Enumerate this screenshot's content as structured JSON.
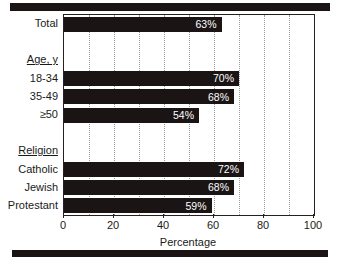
{
  "chart_data": {
    "type": "bar",
    "orientation": "horizontal",
    "title": "",
    "xlabel": "Percentage",
    "ylabel": "",
    "xlim": [
      0,
      100
    ],
    "xticks": [
      0,
      20,
      40,
      60,
      80,
      100
    ],
    "xtick_labels": [
      "0",
      "20",
      "40",
      "60",
      "80",
      "100"
    ],
    "gridlines": [
      10,
      20,
      30,
      40,
      50,
      60,
      70,
      80,
      90
    ],
    "grid": true,
    "legend": null,
    "bar_color": "#1a1414",
    "value_label_color": "#ffffff",
    "value_label_suffix": "%",
    "categories": [
      "Total",
      "18-34",
      "35-49",
      "≥50",
      "Catholic",
      "Jewish",
      "Protestant"
    ],
    "values": [
      63,
      70,
      68,
      54,
      72,
      68,
      59
    ],
    "rows": [
      {
        "kind": "bar",
        "label": "Total",
        "value": 63,
        "value_label": "63%"
      },
      {
        "kind": "spacer",
        "label": "",
        "value": null,
        "value_label": ""
      },
      {
        "kind": "header",
        "label": "Age, y",
        "value": null,
        "value_label": ""
      },
      {
        "kind": "bar",
        "label": "18-34",
        "value": 70,
        "value_label": "70%"
      },
      {
        "kind": "bar",
        "label": "35-49",
        "value": 68,
        "value_label": "68%"
      },
      {
        "kind": "bar",
        "label": "≥50",
        "value": 54,
        "value_label": "54%"
      },
      {
        "kind": "spacer",
        "label": "",
        "value": null,
        "value_label": ""
      },
      {
        "kind": "header",
        "label": "Religion",
        "value": null,
        "value_label": ""
      },
      {
        "kind": "bar",
        "label": "Catholic",
        "value": 72,
        "value_label": "72%"
      },
      {
        "kind": "bar",
        "label": "Jewish",
        "value": 68,
        "value_label": "68%"
      },
      {
        "kind": "bar",
        "label": "Protestant",
        "value": 59,
        "value_label": "59%"
      }
    ]
  }
}
